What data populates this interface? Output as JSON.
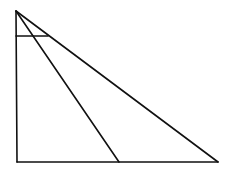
{
  "diagram": {
    "type": "geometry",
    "stroke_color": "#111111",
    "background": "#ffffff",
    "points": {
      "A": {
        "x": 16,
        "y": 11
      },
      "B": {
        "x": 17,
        "y": 162
      },
      "C": {
        "x": 218,
        "y": 162
      },
      "D": {
        "x": 119,
        "y": 162
      },
      "E": {
        "x": 16,
        "y": 36
      },
      "F": {
        "x": 48,
        "y": 36
      }
    },
    "segments": [
      {
        "name": "AB",
        "from": "A",
        "to": "B"
      },
      {
        "name": "BC",
        "from": "B",
        "to": "C"
      },
      {
        "name": "AC",
        "from": "A",
        "to": "C"
      },
      {
        "name": "AD",
        "from": "A",
        "to": "D"
      },
      {
        "name": "EF",
        "from": "E",
        "to": "F"
      }
    ]
  }
}
